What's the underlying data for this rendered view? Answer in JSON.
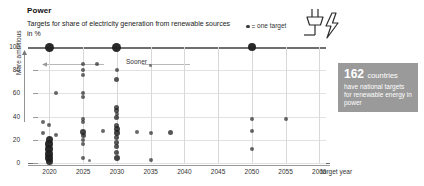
{
  "header": {
    "title": "Power",
    "subtitle": "Targets for share of electricity generation from renewable sources in %"
  },
  "legend": {
    "marker_icon": "dot-icon",
    "equals": "=",
    "label": "one target"
  },
  "icons": {
    "plug": "plug-icon",
    "bolt": "lightning-bolt-icon",
    "up_arrow": "up-arrow-icon",
    "left_arrow": "left-arrow-icon"
  },
  "callout": {
    "number": "162",
    "unit": "countries",
    "text": "have national targets for renewable energy in power",
    "background": "#9a9a9a",
    "text_color": "#ffffff"
  },
  "annotations": {
    "sooner": "Sooner",
    "more_ambitious": "More ambitious"
  },
  "chart_data": {
    "type": "scatter",
    "title": "Power",
    "subtitle": "Targets for share of electricity generation from renewable sources in %",
    "xlabel": "target year",
    "ylabel": "More ambitious",
    "xlim": [
      2018,
      2061
    ],
    "ylim": [
      0,
      100
    ],
    "xticks": [
      2020,
      2025,
      2030,
      2035,
      2040,
      2045,
      2050,
      2055,
      2060
    ],
    "yticks": [
      0,
      20,
      40,
      60,
      80,
      100
    ],
    "grid": true,
    "legend_position": "top-right",
    "marker_color": "#2b2b2b",
    "points": [
      {
        "x": 2020,
        "y": 100,
        "w": 9
      },
      {
        "x": 2030,
        "y": 100,
        "w": 9
      },
      {
        "x": 2050,
        "y": 100,
        "w": 8
      },
      {
        "x": 2025,
        "y": 85,
        "w": 4
      },
      {
        "x": 2025,
        "y": 80,
        "w": 4
      },
      {
        "x": 2025,
        "y": 76,
        "w": 4
      },
      {
        "x": 2027,
        "y": 85,
        "w": 4
      },
      {
        "x": 2035,
        "y": 84,
        "w": 2.5
      },
      {
        "x": 2030,
        "y": 80,
        "w": 4
      },
      {
        "x": 2030,
        "y": 72,
        "w": 5
      },
      {
        "x": 2025,
        "y": 60,
        "w": 4
      },
      {
        "x": 2025,
        "y": 57,
        "w": 4
      },
      {
        "x": 2021,
        "y": 60,
        "w": 4
      },
      {
        "x": 2030,
        "y": 48,
        "w": 5
      },
      {
        "x": 2030,
        "y": 45,
        "w": 5
      },
      {
        "x": 2030,
        "y": 42,
        "w": 4
      },
      {
        "x": 2030,
        "y": 39,
        "w": 5
      },
      {
        "x": 2025,
        "y": 38,
        "w": 4
      },
      {
        "x": 2025,
        "y": 35,
        "w": 4
      },
      {
        "x": 2019,
        "y": 35,
        "w": 4
      },
      {
        "x": 2020,
        "y": 33,
        "w": 4
      },
      {
        "x": 2050,
        "y": 38,
        "w": 4
      },
      {
        "x": 2055,
        "y": 38,
        "w": 4
      },
      {
        "x": 2050,
        "y": 28,
        "w": 4
      },
      {
        "x": 2050,
        "y": 12,
        "w": 4
      },
      {
        "x": 2030,
        "y": 32,
        "w": 5
      },
      {
        "x": 2030,
        "y": 29,
        "w": 6
      },
      {
        "x": 2030,
        "y": 26,
        "w": 6
      },
      {
        "x": 2028,
        "y": 28,
        "w": 4
      },
      {
        "x": 2033,
        "y": 27,
        "w": 4
      },
      {
        "x": 2035,
        "y": 26,
        "w": 4
      },
      {
        "x": 2038,
        "y": 26,
        "w": 5
      },
      {
        "x": 2025,
        "y": 27,
        "w": 6
      },
      {
        "x": 2025,
        "y": 24,
        "w": 5
      },
      {
        "x": 2025,
        "y": 20,
        "w": 4
      },
      {
        "x": 2025,
        "y": 16,
        "w": 4
      },
      {
        "x": 2019,
        "y": 26,
        "w": 4
      },
      {
        "x": 2021,
        "y": 24,
        "w": 4
      },
      {
        "x": 2030,
        "y": 22,
        "w": 5
      },
      {
        "x": 2030,
        "y": 18,
        "w": 5
      },
      {
        "x": 2030,
        "y": 14,
        "w": 5
      },
      {
        "x": 2030,
        "y": 9,
        "w": 5
      },
      {
        "x": 2030,
        "y": 4,
        "w": 6
      },
      {
        "x": 2020,
        "y": 20,
        "w": 7
      },
      {
        "x": 2020,
        "y": 16,
        "w": 8
      },
      {
        "x": 2020,
        "y": 12,
        "w": 8
      },
      {
        "x": 2020,
        "y": 8,
        "w": 8
      },
      {
        "x": 2020,
        "y": 4,
        "w": 8
      },
      {
        "x": 2020,
        "y": 1,
        "w": 7
      },
      {
        "x": 2025,
        "y": 4,
        "w": 4
      },
      {
        "x": 2035,
        "y": 3,
        "w": 4
      },
      {
        "x": 2026,
        "y": 2,
        "w": 3
      }
    ]
  }
}
